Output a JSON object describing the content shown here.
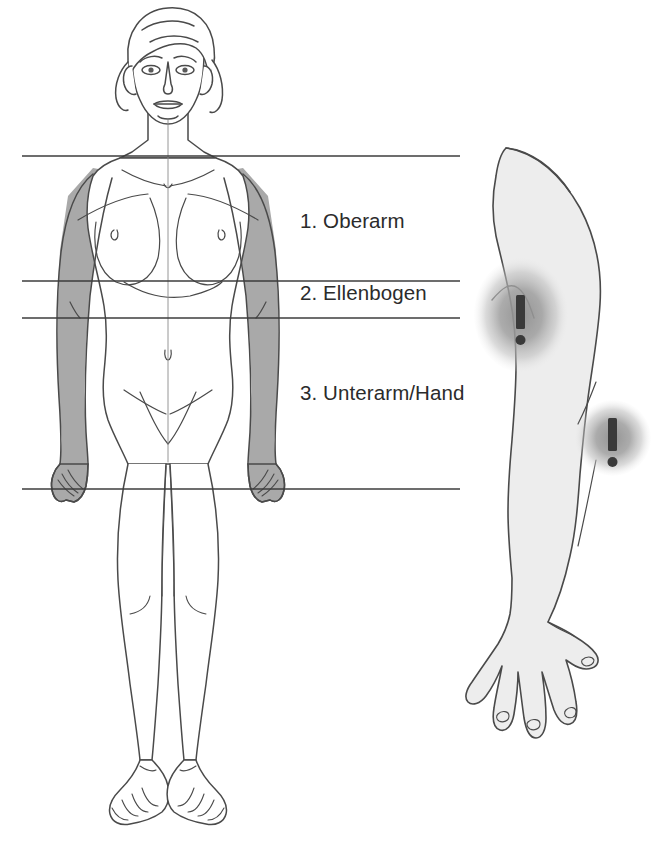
{
  "figure": {
    "kind": "anatomical-diagram",
    "title_visible": false,
    "background_color": "#ffffff",
    "line_color": "#4a4a4a",
    "shade_arm_color": "#a9a9a9",
    "limb_fill_color": "#ededed",
    "blob_color": "#9b9b9b",
    "mark_color": "#3a3a3a"
  },
  "labels": [
    {
      "id": "1",
      "text": "1. Oberarm",
      "x": 300,
      "y": 209
    },
    {
      "id": "2",
      "text": "2. Ellenbogen",
      "x": 300,
      "y": 281
    },
    {
      "id": "3",
      "text": "3. Unterarm/Hand",
      "x": 300,
      "y": 381
    }
  ],
  "divider_lines": [
    {
      "id": "shoulder-line",
      "y": 156,
      "x1": 22,
      "x2": 460
    },
    {
      "id": "elbow-upper-line",
      "y": 281,
      "x1": 22,
      "x2": 460
    },
    {
      "id": "elbow-lower-line",
      "y": 318,
      "x1": 22,
      "x2": 460
    },
    {
      "id": "hand-line",
      "y": 489,
      "x1": 22,
      "x2": 460
    }
  ],
  "warning_markers": [
    {
      "id": "upper-arm-warning",
      "glyph": "!",
      "cx": 521,
      "cy": 315,
      "rx": 45,
      "ry": 55
    },
    {
      "id": "forearm-warning",
      "glyph": "!",
      "cx": 613,
      "cy": 438,
      "rx": 37,
      "ry": 37
    }
  ],
  "body_figure": {
    "name": "female-body-front-view",
    "shaded_regions": [
      "left-arm",
      "right-arm"
    ]
  },
  "arm_figure": {
    "name": "right-arm-detail",
    "parts": [
      "shoulder",
      "upper-arm",
      "elbow",
      "forearm",
      "wrist",
      "hand"
    ]
  }
}
